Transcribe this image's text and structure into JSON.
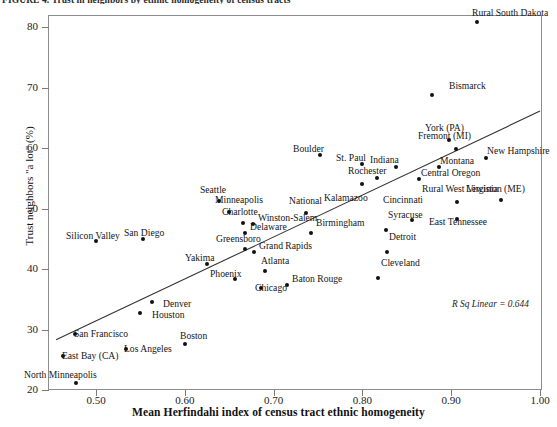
{
  "figure": {
    "title_clipped": "FIGURE 4. Trust in neighbors by ethnic homogeneity of census tracts",
    "annotation": "R Sq Linear = 0.644"
  },
  "axes": {
    "x": {
      "label": "Mean Herfindahi index of census tract ethnic homogeneity",
      "ticks": [
        "0.50",
        "0.60",
        "0.70",
        "0.80",
        "0.90",
        "1.00"
      ],
      "tick_values": [
        0.5,
        0.6,
        0.7,
        0.8,
        0.9,
        1.0
      ],
      "range": [
        0.455,
        1.005
      ]
    },
    "y": {
      "label": "Trust neighbors \"a lot\" (%)",
      "ticks": [
        "20",
        "30",
        "40",
        "50",
        "60",
        "70",
        "80"
      ],
      "tick_values": [
        20,
        30,
        40,
        50,
        60,
        70,
        80
      ],
      "range": [
        20,
        81
      ]
    }
  },
  "chart_data": {
    "type": "scatter",
    "title": "Trust in neighbors by ethnic homogeneity of census tracts",
    "xlabel": "Mean Herfindahi index of census tract ethnic homogeneity",
    "ylabel": "Trust neighbors \"a lot\" (%)",
    "xlim": [
      0.455,
      1.005
    ],
    "ylim": [
      20,
      81
    ],
    "grid": false,
    "legend": null,
    "annotations": [
      "R Sq Linear = 0.644"
    ],
    "r_squared": 0.644,
    "trend_line": {
      "type": "linear",
      "x_start": 0.455,
      "y_start": 28.3,
      "x_end": 1.0,
      "y_end": 66.1
    },
    "points": [
      {
        "label": "North Minneapolis",
        "x": 0.478,
        "y": 21.2,
        "lx": 24,
        "ly": 370,
        "anchor": "above"
      },
      {
        "label": "East Bay (CA)",
        "x": 0.463,
        "y": 25.6,
        "lx": 62,
        "ly": 351,
        "anchor": "right"
      },
      {
        "label": "San Francisco",
        "x": 0.476,
        "y": 29.3,
        "lx": 74,
        "ly": 329,
        "anchor": "right"
      },
      {
        "label": "Los Angeles",
        "x": 0.534,
        "y": 26.8,
        "lx": 124,
        "ly": 344,
        "anchor": "right"
      },
      {
        "label": "Houston",
        "x": 0.549,
        "y": 32.8,
        "lx": 152,
        "ly": 310,
        "anchor": "right"
      },
      {
        "label": "Denver",
        "x": 0.563,
        "y": 34.5,
        "lx": 163,
        "ly": 299,
        "anchor": "right"
      },
      {
        "label": "Boston",
        "x": 0.6,
        "y": 27.6,
        "lx": 180,
        "ly": 331,
        "anchor": "above"
      },
      {
        "label": "Silicon Valley",
        "x": 0.5,
        "y": 44.6,
        "lx": 66,
        "ly": 231,
        "anchor": "above"
      },
      {
        "label": "San Diego",
        "x": 0.553,
        "y": 44.9,
        "lx": 124,
        "ly": 228,
        "anchor": "above"
      },
      {
        "label": "Yakima",
        "x": 0.625,
        "y": 40.9,
        "lx": 185,
        "ly": 253,
        "anchor": "above"
      },
      {
        "label": "Phoenix",
        "x": 0.657,
        "y": 38.3,
        "lx": 210,
        "ly": 269,
        "anchor": "above"
      },
      {
        "label": "Seattle",
        "x": 0.638,
        "y": 51.2,
        "lx": 200,
        "ly": 185,
        "anchor": "above"
      },
      {
        "label": "Minneapolis",
        "x": 0.65,
        "y": 49.5,
        "lx": 215,
        "ly": 195,
        "anchor": "above"
      },
      {
        "label": "Charlotte",
        "x": 0.666,
        "y": 47.6,
        "lx": 222,
        "ly": 207,
        "anchor": "above"
      },
      {
        "label": "Winston-Salem",
        "x": 0.677,
        "y": 47.4,
        "lx": 258,
        "ly": 213,
        "anchor": "right"
      },
      {
        "label": "Delaware",
        "x": 0.668,
        "y": 45.9,
        "lx": 250,
        "ly": 222,
        "anchor": "right"
      },
      {
        "label": "Greensboro",
        "x": 0.668,
        "y": 43.3,
        "lx": 216,
        "ly": 234,
        "anchor": "above"
      },
      {
        "label": "Grand Rapids",
        "x": 0.678,
        "y": 42.8,
        "lx": 259,
        "ly": 241,
        "anchor": "right"
      },
      {
        "label": "Atlanta",
        "x": 0.69,
        "y": 39.6,
        "lx": 261,
        "ly": 256,
        "anchor": "right"
      },
      {
        "label": "Chicago",
        "x": 0.686,
        "y": 36.9,
        "lx": 255,
        "ly": 283,
        "anchor": "below"
      },
      {
        "label": "Baton Rouge",
        "x": 0.715,
        "y": 37.3,
        "lx": 292,
        "ly": 274,
        "anchor": "right"
      },
      {
        "label": "National",
        "x": 0.736,
        "y": 49.2,
        "lx": 289,
        "ly": 196,
        "anchor": "above"
      },
      {
        "label": "Birmingham",
        "x": 0.742,
        "y": 45.9,
        "lx": 316,
        "ly": 218,
        "anchor": "right"
      },
      {
        "label": "Boulder",
        "x": 0.752,
        "y": 58.8,
        "lx": 293,
        "ly": 144,
        "anchor": "above"
      },
      {
        "label": "St. Paul",
        "x": 0.799,
        "y": 57.3,
        "lx": 336,
        "ly": 153,
        "anchor": "above"
      },
      {
        "label": "Kalamazoo",
        "x": 0.799,
        "y": 54.1,
        "lx": 324,
        "ly": 193,
        "anchor": "below"
      },
      {
        "label": "Rochester",
        "x": 0.817,
        "y": 55.1,
        "lx": 348,
        "ly": 166,
        "anchor": "above"
      },
      {
        "label": "Indiana",
        "x": 0.838,
        "y": 56.9,
        "lx": 370,
        "ly": 155,
        "anchor": "above"
      },
      {
        "label": "Cincinnati",
        "x": 0.856,
        "y": 48.1,
        "lx": 383,
        "ly": 195,
        "anchor": "above"
      },
      {
        "label": "Syracuse",
        "x": 0.827,
        "y": 46.5,
        "lx": 388,
        "ly": 210,
        "anchor": "right"
      },
      {
        "label": "Detroit",
        "x": 0.828,
        "y": 42.8,
        "lx": 389,
        "ly": 232,
        "anchor": "right"
      },
      {
        "label": "Cleveland",
        "x": 0.818,
        "y": 38.5,
        "lx": 381,
        "ly": 258,
        "anchor": "right"
      },
      {
        "label": "Central Oregon",
        "x": 0.864,
        "y": 54.9,
        "lx": 421,
        "ly": 168,
        "anchor": "right"
      },
      {
        "label": "Montana",
        "x": 0.886,
        "y": 56.9,
        "lx": 440,
        "ly": 156,
        "anchor": "right"
      },
      {
        "label": "York (PA)",
        "x": 0.897,
        "y": 61.3,
        "lx": 425,
        "ly": 123,
        "anchor": "above"
      },
      {
        "label": "Fremont (MI)",
        "x": 0.905,
        "y": 59.9,
        "lx": 418,
        "ly": 131,
        "anchor": "above"
      },
      {
        "label": "New Hampshire",
        "x": 0.939,
        "y": 58.4,
        "lx": 487,
        "ly": 146,
        "anchor": "right"
      },
      {
        "label": "Rural West Virginia",
        "x": 0.907,
        "y": 51.1,
        "lx": 422,
        "ly": 184,
        "anchor": "above"
      },
      {
        "label": "East Tennessee",
        "x": 0.907,
        "y": 48.2,
        "lx": 429,
        "ly": 217,
        "anchor": "below"
      },
      {
        "label": "Lewiston (ME)",
        "x": 0.956,
        "y": 51.4,
        "lx": 466,
        "ly": 184,
        "anchor": "above"
      },
      {
        "label": "Bismarck",
        "x": 0.878,
        "y": 68.8,
        "lx": 449,
        "ly": 81,
        "anchor": "above"
      },
      {
        "label": "Rural South Dakota",
        "x": 0.929,
        "y": 80.8,
        "lx": 472,
        "ly": 8,
        "anchor": "above"
      }
    ]
  }
}
